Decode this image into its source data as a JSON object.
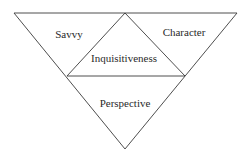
{
  "diagram": {
    "type": "inverted-triangle-partition",
    "outer_triangle": {
      "vertices": [
        [
          14,
          13
        ],
        [
          237,
          13
        ],
        [
          125,
          149
        ]
      ]
    },
    "midpoints": {
      "top": [
        125,
        13
      ],
      "left": [
        67,
        76
      ],
      "right": [
        185,
        76
      ]
    },
    "stroke_color": "#3a3a3a",
    "text_color": "#2a2a2a",
    "regions": [
      {
        "id": "top-left",
        "label": "Savvy",
        "x": 69,
        "y": 38
      },
      {
        "id": "top-right",
        "label": "Character",
        "x": 184,
        "y": 36
      },
      {
        "id": "center",
        "label": "Inquisitiveness",
        "x": 124,
        "y": 62
      },
      {
        "id": "bottom",
        "label": "Perspective",
        "x": 125,
        "y": 107
      }
    ]
  }
}
